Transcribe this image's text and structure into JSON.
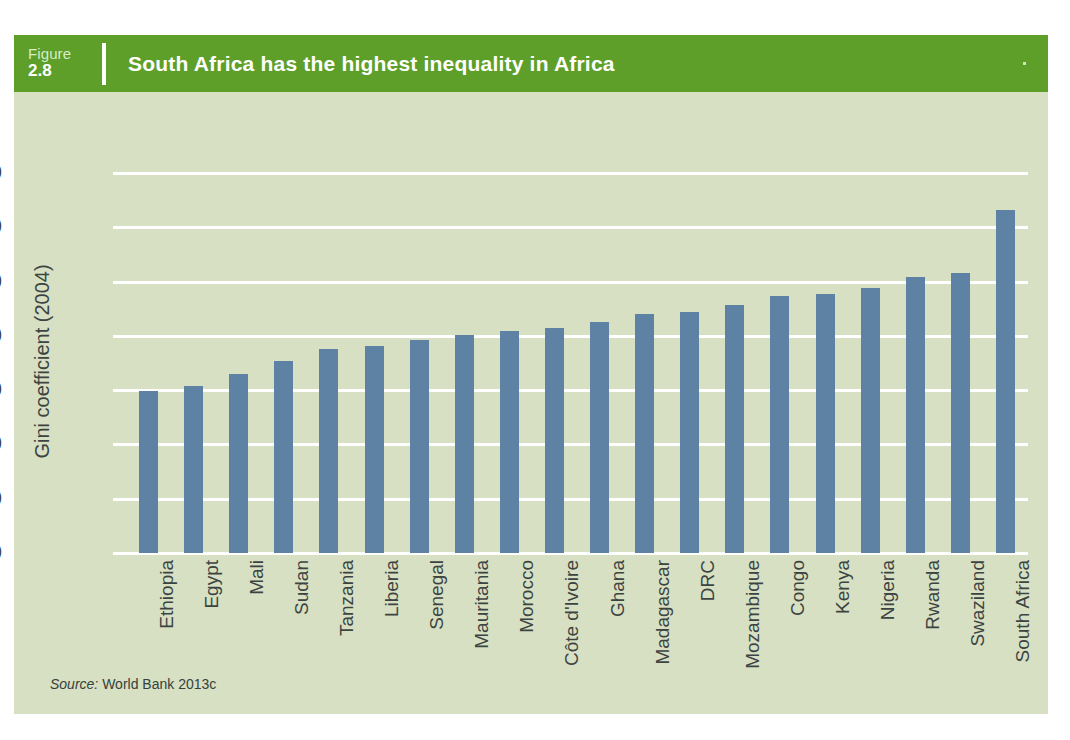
{
  "figure": {
    "number_word": "Figure",
    "number": "2.8",
    "title": "South Africa has the highest inequality in Africa",
    "header_color": "#5e9f2a",
    "panel_color": "#d7e0c2",
    "bar_color": "#5d82a3",
    "gridline_color": "#ffffff",
    "text_color": "#3c4442"
  },
  "source": {
    "label": "Source:",
    "text": "World Bank 2013c"
  },
  "chart_data": {
    "type": "bar",
    "title": "South Africa has the highest inequality in Africa",
    "xlabel": "",
    "ylabel": "Gini coefficient (2004)",
    "ylim": [
      0,
      70
    ],
    "yticks": [
      0,
      10,
      20,
      30,
      40,
      50,
      60,
      70
    ],
    "grid": true,
    "legend": "none",
    "categories": [
      "Ethiopia",
      "Egypt",
      "Mali",
      "Sudan",
      "Tanzania",
      "Liberia",
      "Senegal",
      "Mauritania",
      "Morocco",
      "Côte d'Ivoire",
      "Ghana",
      "Madagascar",
      "DRC",
      "Mozambique",
      "Congo",
      "Kenya",
      "Nigeria",
      "Rwanda",
      "Swaziland",
      "South Africa"
    ],
    "values": [
      29.8,
      30.8,
      33.0,
      35.3,
      37.6,
      38.2,
      39.2,
      40.1,
      40.9,
      41.5,
      42.6,
      44.0,
      44.4,
      45.6,
      47.3,
      47.7,
      48.8,
      50.8,
      51.5,
      63.1
    ]
  }
}
